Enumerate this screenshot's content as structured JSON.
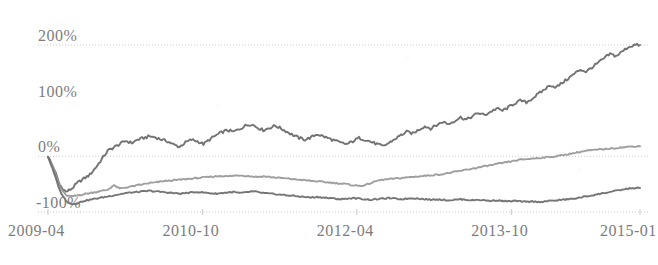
{
  "chart_data": {
    "type": "line",
    "title": "",
    "subtitle": "",
    "xlabel": "",
    "ylabel": "",
    "grid": true,
    "legend_position": "none",
    "xlim": [
      0,
      70
    ],
    "ylim": [
      -100,
      200
    ],
    "y_ticks": [
      {
        "value": 200,
        "label": "200%"
      },
      {
        "value": 100,
        "label": "100%"
      },
      {
        "value": 0,
        "label": "0%"
      },
      {
        "value": -100,
        "label": "-100%"
      }
    ],
    "x_ticks": [
      {
        "index": 0,
        "label": "2009-04"
      },
      {
        "index": 18,
        "label": "2010-10"
      },
      {
        "index": 36,
        "label": "2012-04"
      },
      {
        "index": 54,
        "label": "2013-10"
      },
      {
        "index": 69,
        "label": "2015-01"
      }
    ],
    "colors": {
      "series_top": "#6b6b6b",
      "series_middle": "#9a9a9a",
      "series_bottom": "#6e6e6e",
      "gridline": "#c9c9c9",
      "tick_label": "#7c7c7c",
      "background": "#ffffff"
    },
    "series": [
      {
        "name": "series-top",
        "color": "#6b6b6b",
        "values": [
          0,
          -22,
          -52,
          -64,
          -58,
          -47,
          -40,
          -33,
          -20,
          -5,
          10,
          16,
          22,
          28,
          24,
          30,
          33,
          36,
          34,
          30,
          27,
          21,
          17,
          25,
          30,
          27,
          22,
          30,
          37,
          43,
          47,
          44,
          49,
          55,
          58,
          52,
          47,
          51,
          55,
          50,
          44,
          38,
          33,
          30,
          34,
          40,
          36,
          32,
          28,
          24,
          22,
          27,
          33,
          30,
          26,
          22,
          18,
          24,
          31,
          38,
          44,
          41,
          48,
          54,
          50,
          56,
          62,
          58,
          64,
          70,
          66,
          72,
          78,
          74,
          80,
          86,
          82,
          88,
          95,
          100,
          97,
          104,
          112,
          120,
          128,
          124,
          132,
          140,
          148,
          156,
          152,
          160,
          168,
          176,
          184,
          180,
          188,
          196,
          200,
          200
        ]
      },
      {
        "name": "series-middle",
        "color": "#9a9a9a",
        "values": [
          0,
          -24,
          -55,
          -70,
          -72,
          -70,
          -68,
          -66,
          -64,
          -62,
          -60,
          -52,
          -58,
          -56,
          -54,
          -52,
          -50,
          -48,
          -47,
          -45,
          -44,
          -43,
          -42,
          -41,
          -40,
          -39,
          -38,
          -37,
          -36,
          -35,
          -36,
          -35,
          -34,
          -35,
          -36,
          -37,
          -36,
          -37,
          -38,
          -39,
          -40,
          -41,
          -42,
          -43,
          -44,
          -45,
          -46,
          -47,
          -48,
          -49,
          -50,
          -52,
          -53,
          -52,
          -48,
          -44,
          -42,
          -41,
          -40,
          -39,
          -38,
          -37,
          -36,
          -35,
          -34,
          -33,
          -32,
          -30,
          -28,
          -26,
          -24,
          -22,
          -20,
          -18,
          -16,
          -14,
          -12,
          -10,
          -8,
          -6,
          -5,
          -4,
          -3,
          -2,
          -1,
          0,
          2,
          4,
          6,
          8,
          10,
          11,
          12,
          13,
          14,
          15,
          16,
          17,
          18,
          18
        ]
      },
      {
        "name": "series-bottom",
        "color": "#6e6e6e",
        "values": [
          0,
          -30,
          -62,
          -80,
          -86,
          -84,
          -80,
          -78,
          -76,
          -74,
          -72,
          -70,
          -68,
          -66,
          -65,
          -64,
          -63,
          -62,
          -63,
          -64,
          -65,
          -66,
          -67,
          -66,
          -65,
          -64,
          -65,
          -66,
          -67,
          -66,
          -65,
          -64,
          -66,
          -65,
          -63,
          -64,
          -66,
          -67,
          -68,
          -69,
          -70,
          -71,
          -72,
          -73,
          -74,
          -73,
          -74,
          -75,
          -76,
          -77,
          -76,
          -75,
          -76,
          -77,
          -78,
          -77,
          -76,
          -75,
          -76,
          -77,
          -76,
          -75,
          -76,
          -77,
          -78,
          -77,
          -78,
          -79,
          -78,
          -77,
          -78,
          -79,
          -78,
          -79,
          -80,
          -79,
          -80,
          -81,
          -80,
          -81,
          -82,
          -81,
          -82,
          -81,
          -80,
          -79,
          -78,
          -77,
          -76,
          -74,
          -72,
          -70,
          -68,
          -66,
          -64,
          -62,
          -60,
          -58,
          -57,
          -57
        ]
      }
    ]
  }
}
